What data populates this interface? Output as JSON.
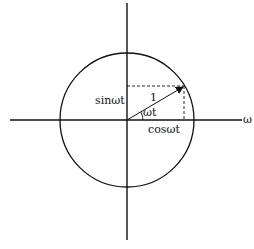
{
  "diagram": {
    "labels": {
      "sin": "sinωt",
      "cos": "cosωt",
      "angle": "ωt",
      "magnitude": "1",
      "axis_x": "ω"
    },
    "colors": {
      "stroke": "#111111",
      "background": "#ffffff"
    }
  }
}
